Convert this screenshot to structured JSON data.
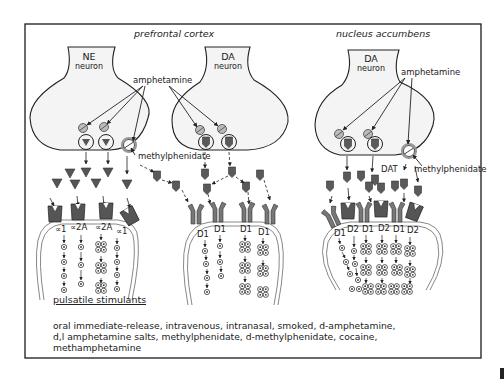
{
  "figure": {
    "panels": [
      {
        "region": "prefrontal cortex",
        "neurons": [
          {
            "name": "NE",
            "sub": "neuron"
          },
          {
            "name": "DA",
            "sub": "neuron"
          }
        ],
        "drug_labels": [
          "amphetamine",
          "methylphenidate"
        ],
        "receptors": [
          "∝1",
          "∝2A",
          "∝2A",
          "∝1",
          "D1",
          "D1",
          "D1",
          "D1"
        ]
      },
      {
        "region": "nucleus accumbens",
        "neurons": [
          {
            "name": "DA",
            "sub": "neuron"
          }
        ],
        "drug_labels": [
          "amphetamine",
          "methylphenidate",
          "DAT"
        ],
        "receptors": [
          "D1",
          "D2",
          "D1",
          "D2",
          "D1",
          "D2"
        ]
      }
    ],
    "section_title": "pulsatile stimulants",
    "description_lines": [
      "oral immediate-release, intravenous, intranasal, smoked, d-amphetamine,",
      "d,l amphetamine salts, methylphenidate, d-methylphenidate, cocaine,",
      "methamphetamine"
    ],
    "colors": {
      "frame": "#1a1a1a",
      "neuron_fill": "#f4f4f4",
      "transmitter": "#555555",
      "receptor": "#6a6a6a",
      "membrane": "#8a8a8a"
    }
  }
}
